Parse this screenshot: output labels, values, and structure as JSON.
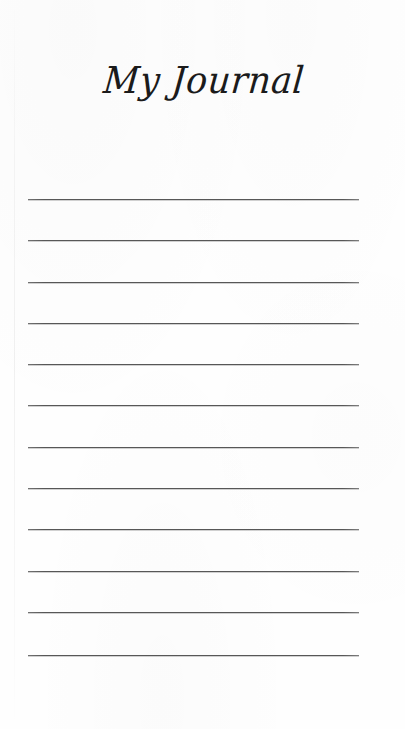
{
  "page": {
    "width": 405,
    "height": 729,
    "background_color": "#fefefe",
    "kind": "journal-page"
  },
  "title": {
    "text": "My Journal",
    "color": "#1b1b1b",
    "style": "script",
    "align": "center"
  },
  "ruled_lines": {
    "count": 12,
    "color": "#575757",
    "left": 28,
    "width": 331,
    "thickness": 1,
    "spacing": 41.4,
    "y_positions": [
      199,
      240,
      282,
      323,
      364,
      405,
      447,
      488,
      529,
      571,
      612,
      655
    ]
  },
  "artifacts": {
    "paper_edge_x": 14
  }
}
